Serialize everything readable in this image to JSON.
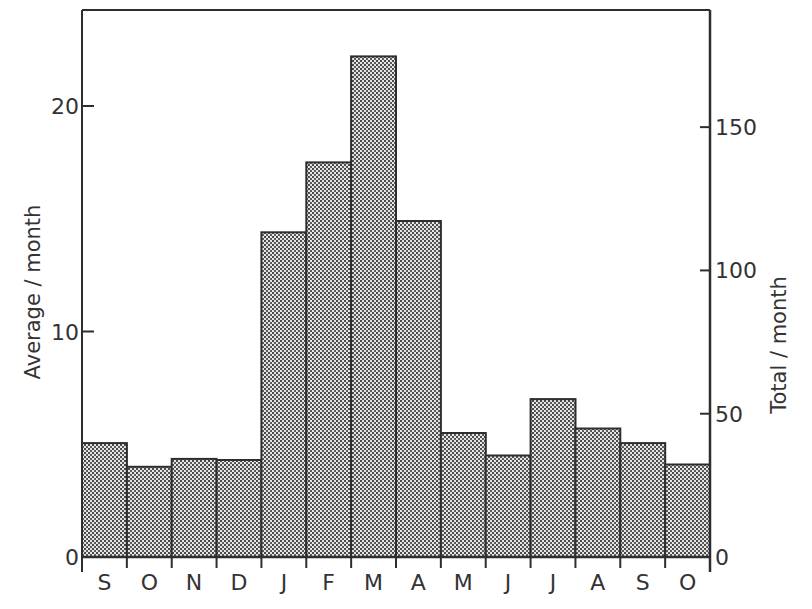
{
  "chart_data": {
    "type": "bar",
    "title": "",
    "xlabel": "",
    "ylabel": "Average / month",
    "ylabel_right": "Total / month",
    "categories": [
      "S",
      "O",
      "N",
      "D",
      "J",
      "F",
      "M",
      "A",
      "M",
      "J",
      "J",
      "A",
      "S",
      "O"
    ],
    "values": [
      5.05,
      4.0,
      4.35,
      4.3,
      14.4,
      17.5,
      22.2,
      14.9,
      5.5,
      4.5,
      7.0,
      5.7,
      5.05,
      4.1
    ],
    "ylim": [
      0,
      24.4
    ],
    "y_ticks": [
      0,
      10,
      20
    ],
    "ylim_right": [
      0,
      192
    ],
    "y_right_ticks": [
      0,
      50,
      100,
      150
    ],
    "grid": false,
    "legend": null,
    "bar_fill": "stippled grey",
    "colors": {
      "bar_fill": "#9a9a9a",
      "bar_edge": "#2e2e2e",
      "axis": "#2e2e2e"
    }
  },
  "labels": {
    "left_axis_title": "Average / month",
    "right_axis_title": "Total / month",
    "left_ticks": [
      "0",
      "10",
      "20"
    ],
    "right_ticks": [
      "0",
      "50",
      "100",
      "150"
    ],
    "months": [
      "S",
      "O",
      "N",
      "D",
      "J",
      "F",
      "M",
      "A",
      "M",
      "J",
      "J",
      "A",
      "S",
      "O"
    ]
  }
}
